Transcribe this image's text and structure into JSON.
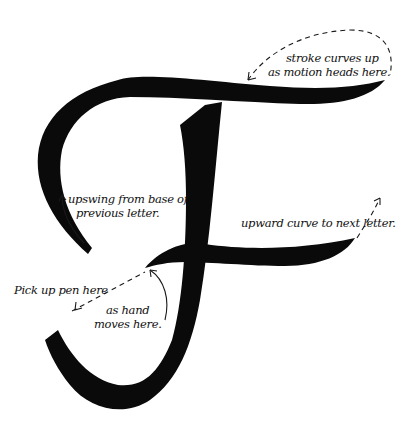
{
  "figure": {
    "ink_color": "#0a0a0a",
    "background": "#ffffff"
  },
  "annotations": {
    "stroke_curves": {
      "line1": "stroke curves up",
      "line2": "as motion heads here."
    },
    "upswing": {
      "line1": "upswing from base of",
      "line2": "previous letter."
    },
    "upward_curve": {
      "line1": "upward curve to next letter."
    },
    "pick_up_pen": {
      "line1": "Pick up pen here"
    },
    "as_hand": {
      "line1": "as hand",
      "line2": "moves here."
    }
  }
}
